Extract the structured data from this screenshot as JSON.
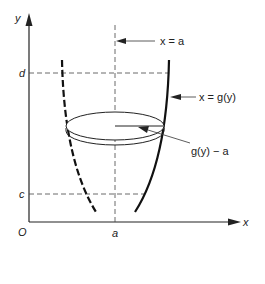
{
  "diagram": {
    "axes": {
      "x_label": "x",
      "y_label": "y",
      "origin_label": "O"
    },
    "ticks": {
      "x_tick": "a",
      "y_tick_upper": "d",
      "y_tick_lower": "c"
    },
    "annotations": {
      "axis_of_rotation": "x = a",
      "curve": "x = g(y)",
      "radius": "g(y) − a"
    },
    "colors": {
      "ink": "#222222",
      "background": "#ffffff"
    }
  }
}
